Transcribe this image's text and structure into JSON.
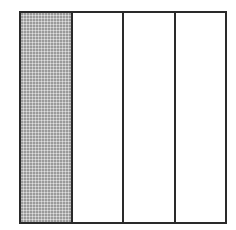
{
  "diagram": {
    "type": "fraction-model",
    "total_parts": 4,
    "shaded_parts": 1,
    "fraction_label": "1/4",
    "orientation": "vertical-columns",
    "parts": [
      {
        "index": 1,
        "shaded": true
      },
      {
        "index": 2,
        "shaded": false
      },
      {
        "index": 3,
        "shaded": false
      },
      {
        "index": 4,
        "shaded": false
      }
    ],
    "colors": {
      "border": "#2a2a2a",
      "shade": "#c4c4c4",
      "unshaded": "#ffffff",
      "background": "#ffffff"
    }
  }
}
